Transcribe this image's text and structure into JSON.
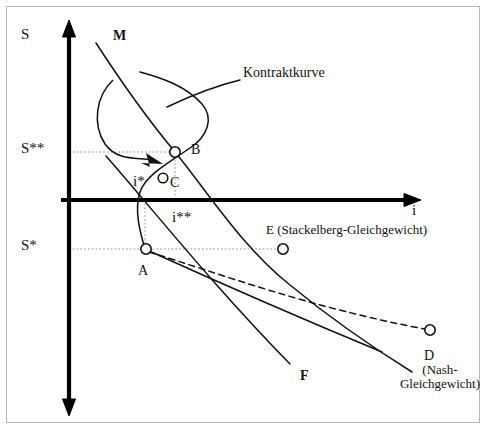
{
  "figure": {
    "axes": {
      "y_axis_label": "S",
      "x_axis_label": "i",
      "y_tick_upper_label": "S**",
      "y_tick_lower_label": "S*",
      "x_tick_inner_label": "i*",
      "x_tick_outer_label": "i**"
    },
    "curves": [
      {
        "id": "kontraktkurve",
        "label": "Kontraktkurve"
      },
      {
        "id": "m-curve",
        "label": "M"
      },
      {
        "id": "f-curve",
        "label": "F"
      }
    ],
    "points": [
      {
        "id": "B",
        "label": "B"
      },
      {
        "id": "C",
        "label": "C"
      },
      {
        "id": "A",
        "label": "A"
      },
      {
        "id": "E",
        "label": "E (Stackelberg-Gleichgewicht)"
      },
      {
        "id": "D",
        "label": "D",
        "sublabel_line1": "(Nash-",
        "sublabel_line2": "Gleichgewicht)"
      }
    ],
    "colors": {
      "ink": "#111111",
      "frame": "#b9b9b9",
      "guide": "#8d8d8d",
      "paper": "#ffffff"
    }
  },
  "caption": {
    "text": ""
  }
}
